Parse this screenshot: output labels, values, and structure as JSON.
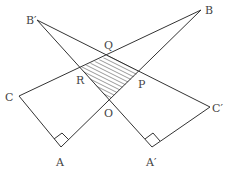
{
  "figure": {
    "colors": {
      "line": "#333333",
      "label": "#444444",
      "hatch": "#555555",
      "background": "#ffffff"
    },
    "points": {
      "B_prime": {
        "label": "B′",
        "x": 37,
        "y": 20,
        "lx": 28,
        "ly": 24
      },
      "B": {
        "label": "B",
        "x": 201,
        "y": 10,
        "lx": 205,
        "ly": 14
      },
      "C": {
        "label": "C",
        "x": 19,
        "y": 96,
        "lx": 5,
        "ly": 101
      },
      "C_prime": {
        "label": "C′",
        "x": 210,
        "y": 107,
        "lx": 212,
        "ly": 112
      },
      "A": {
        "label": "A",
        "x": 61,
        "y": 147,
        "lx": 56,
        "ly": 166
      },
      "A_prime": {
        "label": "A′",
        "x": 152,
        "y": 147,
        "lx": 146,
        "ly": 166
      },
      "O": {
        "label": "O",
        "x": 109,
        "y": 100,
        "lx": 104,
        "ly": 117
      },
      "Q": {
        "label": "Q",
        "x": 110,
        "y": 55,
        "lx": 103,
        "ly": 48
      },
      "R": {
        "label": "R",
        "x": 80,
        "y": 68,
        "lx": 77,
        "ly": 83
      },
      "P": {
        "label": "P",
        "x": 139,
        "y": 72,
        "lx": 138,
        "ly": 87
      }
    },
    "shaded_region": [
      "Q",
      "R",
      "O",
      "P"
    ],
    "right_angles": [
      "A",
      "A′"
    ]
  }
}
